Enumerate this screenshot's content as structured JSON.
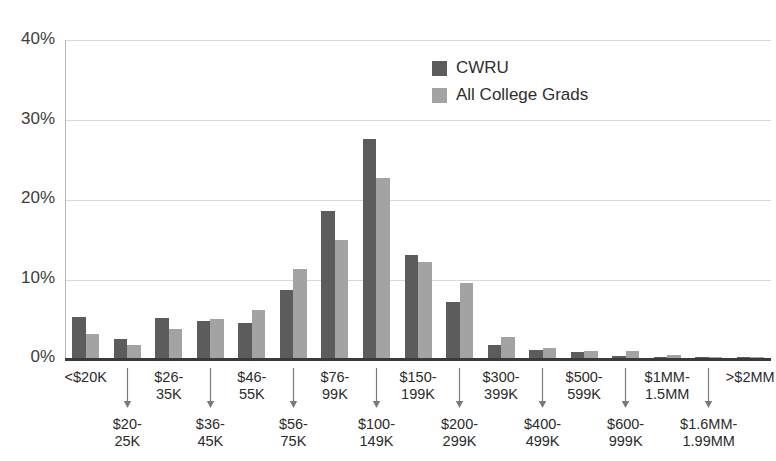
{
  "chart_data": {
    "type": "bar",
    "title": "",
    "subtitle": "",
    "xlabel": "",
    "ylabel": "",
    "ylim": [
      0,
      40
    ],
    "ytick_labels": [
      "0%",
      "10%",
      "20%",
      "30%",
      "40%"
    ],
    "ytick_values": [
      0,
      10,
      20,
      30,
      40
    ],
    "grid": true,
    "grid_axis": "y",
    "legend_position": "top-center-right",
    "categories": [
      "<$20K",
      "$20-25K",
      "$26-35K",
      "$36-45K",
      "$46-55K",
      "$56-75K",
      "$76-99K",
      "$100-149K",
      "$150-199K",
      "$200-299K",
      "$300-399K",
      "$400-499K",
      "$500-599K",
      "$600-999K",
      "$1MM-1.5MM",
      "$1.6MM-1.99MM",
      ">$2MM"
    ],
    "category_label_rows": [
      [
        "<$20K",
        ""
      ],
      [
        "",
        "$20-\n25K"
      ],
      [
        "$26-\n35K",
        ""
      ],
      [
        "",
        "$36-\n45K"
      ],
      [
        "$46-\n55K",
        ""
      ],
      [
        "",
        "$56-\n75K"
      ],
      [
        "$76-\n99K",
        ""
      ],
      [
        "",
        "$100-\n149K"
      ],
      [
        "$150-\n199K",
        ""
      ],
      [
        "",
        "$200-\n299K"
      ],
      [
        "$300-\n399K",
        ""
      ],
      [
        "",
        "$400-\n499K"
      ],
      [
        "$500-\n599K",
        ""
      ],
      [
        "",
        "$600-\n999K"
      ],
      [
        "$1MM-\n1.5MM",
        ""
      ],
      [
        "",
        "$1.6MM-\n1.99MM"
      ],
      [
        ">$2MM",
        ""
      ]
    ],
    "series": [
      {
        "name": "CWRU",
        "color": "#5c5c5c",
        "values": [
          5.1,
          2.4,
          5.0,
          4.7,
          4.4,
          8.6,
          18.5,
          27.6,
          12.9,
          7.0,
          1.7,
          1.0,
          0.8,
          0.2,
          0.15,
          0.1,
          0.1
        ]
      },
      {
        "name": "All College Grads",
        "color": "#a3a3a3",
        "values": [
          3.0,
          1.7,
          3.7,
          4.9,
          6.0,
          11.2,
          14.8,
          22.6,
          12.1,
          9.4,
          2.7,
          1.3,
          0.9,
          0.9,
          0.4,
          0.15,
          0.1
        ]
      }
    ]
  },
  "legend": {
    "items": [
      {
        "label": "CWRU",
        "color": "#5c5c5c"
      },
      {
        "label": "All College Grads",
        "color": "#a3a3a3"
      }
    ]
  },
  "colors": {
    "background": "#ffffff",
    "cwru_bar": "#5c5c5c",
    "all_grads_bar": "#a3a3a3",
    "gridline": "#d8d8d8",
    "axis": "#3a3a3a",
    "text": "#2b2b2b"
  }
}
